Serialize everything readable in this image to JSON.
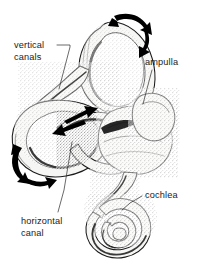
{
  "figure": {
    "background_color": "#ffffff",
    "ink_color": "#1b1b1b",
    "style": "stippled pen-and-ink anatomical line drawing",
    "width": 197,
    "height": 273
  },
  "labels": [
    {
      "id": "vertical-canals",
      "lines": [
        "vertical",
        "canals"
      ],
      "line1": "vertical",
      "line2": "canals",
      "text_x": 14,
      "text_y": 48,
      "align": "start"
    },
    {
      "id": "ampulla",
      "lines": [
        "ampulla"
      ],
      "line1": "ampulla",
      "text_x": 145,
      "text_y": 65,
      "align": "start"
    },
    {
      "id": "horizontal-canal",
      "lines": [
        "horizontal",
        "canal"
      ],
      "line1": "horizontal",
      "line2": "canal",
      "text_x": 21,
      "text_y": 224,
      "align": "start"
    },
    {
      "id": "cochlea",
      "lines": [
        "cochlea"
      ],
      "line1": "cochlea",
      "text_x": 145,
      "text_y": 198,
      "align": "start"
    }
  ],
  "structures": [
    {
      "id": "superior-vertical-canal",
      "name": "vertical semicircular canal (upper loop)",
      "description": "large upright oval duct loop at top center"
    },
    {
      "id": "posterior-vertical-canal",
      "name": "vertical semicircular canal (lower loop)",
      "description": "duct loop descending to the left toward the vestibule"
    },
    {
      "id": "horizontal-canal",
      "name": "horizontal semicircular canal",
      "description": "broad ring lying to the left, seen nearly edge-on"
    },
    {
      "id": "ampulla",
      "name": "ampulla",
      "description": "bulbous swelling at the canal base on the right of the vestibule"
    },
    {
      "id": "vestibule",
      "name": "vestibule",
      "description": "central sac-like chamber joining the canals to the cochlea"
    },
    {
      "id": "cochlea",
      "name": "cochlea",
      "description": "spiral duct of about two and a half turns at lower right"
    }
  ],
  "arrows": [
    {
      "id": "top-arrow",
      "type": "double-headed-curved",
      "meaning": "plane of rotation sensed by the upper vertical canal",
      "location": "top right, above the vertical canal loop"
    },
    {
      "id": "center-arrow",
      "type": "double-headed-straight",
      "meaning": "plane of rotation sensed by the horizontal canal",
      "location": "center, across the horizontal canal ring"
    },
    {
      "id": "left-arrow",
      "type": "double-headed-curved",
      "meaning": "plane of rotation sensed by the lower vertical canal",
      "location": "left edge, outside the horizontal canal"
    }
  ]
}
